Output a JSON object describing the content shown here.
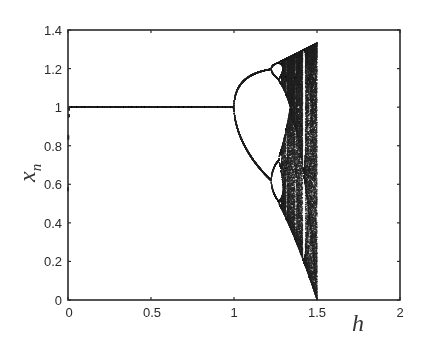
{
  "chart_data": {
    "type": "scatter",
    "title": "",
    "subtitle": "",
    "xlabel": "h",
    "ylabel": "x_n",
    "ylabel_main": "x",
    "ylabel_sub": "n",
    "xlim": [
      0,
      2
    ],
    "ylim": [
      0,
      1.4
    ],
    "grid": false,
    "legend": null,
    "x_ticks": [
      "0",
      "0.5",
      "1",
      "1.5",
      "2"
    ],
    "x_tick_values": [
      0,
      0.5,
      1,
      1.5,
      2
    ],
    "y_ticks": [
      "0",
      "0.2",
      "0.4",
      "0.6",
      "0.8",
      "1",
      "1.2",
      "1.4"
    ],
    "y_tick_values": [
      0,
      0.2,
      0.4,
      0.6,
      0.8,
      1,
      1.2,
      1.4
    ],
    "series": [
      {
        "name": "fixed point",
        "h_range": [
          0,
          1
        ],
        "x": [
          1,
          1
        ]
      },
      {
        "name": "period-2 branches",
        "h": [
          1.0,
          1.1,
          1.2,
          1.25
        ],
        "upper": [
          1.0,
          1.15,
          1.2,
          1.22
        ],
        "lower": [
          1.0,
          0.78,
          0.65,
          0.6
        ]
      },
      {
        "name": "chaotic band",
        "h_range": [
          1.28,
          1.5
        ],
        "x_max": [
          1.25,
          1.333
        ],
        "x_min": [
          0.5,
          0.0
        ]
      }
    ],
    "map_hint": "x_{n+1} = x_n + 2 h x_n (1 - x_n)"
  },
  "style": {
    "axis_color": "#2a2a2a",
    "point_color": "#222222",
    "background": "#ffffff"
  }
}
